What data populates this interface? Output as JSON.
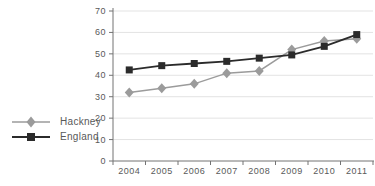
{
  "chart_data": {
    "type": "line",
    "title": "",
    "xlabel": "",
    "ylabel": "",
    "categories": [
      "2004",
      "2005",
      "2006",
      "2007",
      "2008",
      "2009",
      "2010",
      "2011"
    ],
    "series": [
      {
        "name": "Hackney",
        "marker": "diamond",
        "color": "#9b9b9b",
        "values": [
          32,
          34,
          36,
          41,
          42,
          52,
          56,
          57
        ]
      },
      {
        "name": "England",
        "marker": "square",
        "color": "#2b2b2b",
        "values": [
          42.5,
          44.5,
          45.5,
          46.5,
          48,
          49.5,
          53.5,
          59
        ]
      }
    ],
    "ylim": [
      0,
      70
    ],
    "ytick_step": 10,
    "yticks": [
      0,
      10,
      20,
      30,
      40,
      50,
      60,
      70
    ],
    "grid": "horizontal",
    "legend_position": "left"
  },
  "colors": {
    "background": "#ffffff",
    "grid": "#e3e3e3",
    "axis": "#737373",
    "tick_label": "#595959"
  }
}
